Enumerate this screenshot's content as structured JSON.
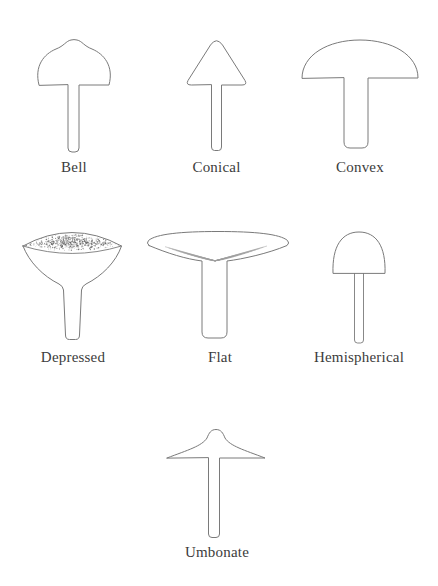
{
  "style": {
    "line_color": "#7a7a7a",
    "label_color": "#3c3c3c",
    "background": "#ffffff"
  },
  "figures": [
    {
      "id": "bell",
      "label": "Bell"
    },
    {
      "id": "conical",
      "label": "Conical"
    },
    {
      "id": "convex",
      "label": "Convex"
    },
    {
      "id": "depressed",
      "label": "Depressed"
    },
    {
      "id": "flat",
      "label": "Flat"
    },
    {
      "id": "hemispherical",
      "label": "Hemispherical"
    },
    {
      "id": "umbonate",
      "label": "Umbonate"
    }
  ]
}
